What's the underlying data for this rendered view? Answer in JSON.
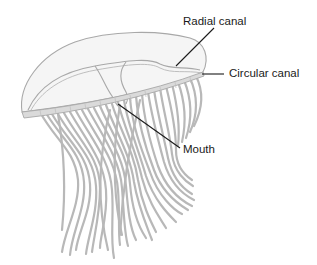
{
  "diagram": {
    "labels": {
      "radial_canal": "Radial canal",
      "circular_canal": "Circular canal",
      "mouth": "Mouth"
    },
    "colors": {
      "outline": "#a8a8a8",
      "bell_fill": "#f4f4f4",
      "margin_band": "#d9d9d9",
      "tentacle": "#b3b3b3",
      "leader_line": "#1a1a1a",
      "text": "#1a1a1a"
    }
  }
}
